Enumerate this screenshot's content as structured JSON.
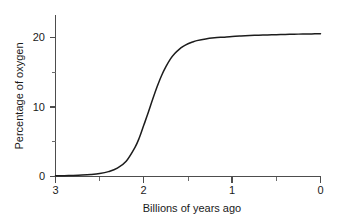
{
  "chart_data": {
    "type": "line",
    "title": "",
    "subtitle": "",
    "xlabel": "Billions of years ago",
    "ylabel": "Percentage of oxygen",
    "xlim": [
      3,
      0
    ],
    "ylim": [
      0,
      23
    ],
    "x_axis_reversed": true,
    "grid": false,
    "legend": false,
    "legend_position": "none",
    "x_ticks_major": [
      "3",
      "2",
      "1",
      "0"
    ],
    "x_tick_values_major": [
      3,
      2,
      1,
      0
    ],
    "x_tick_values_minor": [
      2.5,
      1.5,
      0.5
    ],
    "y_ticks_major": [
      "0",
      "10",
      "20"
    ],
    "y_tick_values_major": [
      0,
      10,
      20
    ],
    "y_tick_values_minor": [
      5,
      15
    ],
    "series": [
      {
        "name": "Atmospheric oxygen",
        "color": "#1c1c1c",
        "x": [
          3.0,
          2.9,
          2.8,
          2.7,
          2.6,
          2.5,
          2.4,
          2.3,
          2.2,
          2.1,
          2.05,
          2.0,
          1.95,
          1.9,
          1.85,
          1.8,
          1.75,
          1.7,
          1.65,
          1.6,
          1.55,
          1.5,
          1.45,
          1.4,
          1.3,
          1.2,
          1.1,
          1.0,
          0.9,
          0.8,
          0.7,
          0.6,
          0.5,
          0.4,
          0.3,
          0.2,
          0.1,
          0.0
        ],
        "y": [
          0.1,
          0.12,
          0.15,
          0.2,
          0.28,
          0.42,
          0.7,
          1.2,
          2.2,
          4.2,
          5.6,
          7.4,
          9.2,
          11.1,
          12.9,
          14.5,
          15.8,
          16.9,
          17.7,
          18.3,
          18.75,
          19.1,
          19.35,
          19.55,
          19.8,
          19.95,
          20.05,
          20.15,
          20.22,
          20.28,
          20.33,
          20.37,
          20.41,
          20.44,
          20.47,
          20.5,
          20.52,
          20.55
        ]
      }
    ],
    "annotations": []
  },
  "axes": {
    "x_title": "Billions of years ago",
    "y_title": "Percentage of oxygen"
  },
  "labels": {
    "x0": "3",
    "x1": "2",
    "x2": "1",
    "x3": "0",
    "y0": "0",
    "y1": "10",
    "y2": "20"
  }
}
